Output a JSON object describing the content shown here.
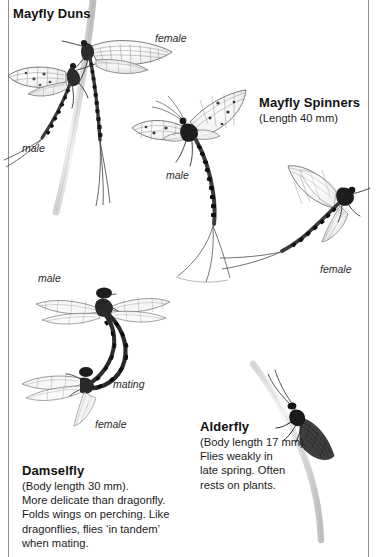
{
  "page": {
    "width": 384,
    "height": 557,
    "background": "#ffffff",
    "rule_color": "#8f8f8f",
    "ink_color": "#1a1a1a"
  },
  "sections": {
    "mayfly_duns": {
      "heading": "Mayfly Duns",
      "labels": [
        {
          "text": "female",
          "x": 155,
          "y": 32
        },
        {
          "text": "male",
          "x": 22,
          "y": 142
        }
      ]
    },
    "mayfly_spinners": {
      "heading": "Mayfly Spinners",
      "subline": "(Length 40 mm)",
      "labels": [
        {
          "text": "male",
          "x": 166,
          "y": 169
        },
        {
          "text": "female",
          "x": 320,
          "y": 263
        }
      ]
    },
    "damselfly": {
      "heading": "Damselfly",
      "blurb": "(Body length 30 mm).\nMore delicate than dragonfly.\nFolds wings on perching. Like\ndragonflies, flies ‘in tandem’\nwhen mating.",
      "labels": [
        {
          "text": "male",
          "x": 38,
          "y": 272
        },
        {
          "text": "mating",
          "x": 113,
          "y": 378
        },
        {
          "text": "female",
          "x": 95,
          "y": 418
        }
      ]
    },
    "alderfly": {
      "heading": "Alderfly",
      "blurb": "(Body length 17 mm).\nFlies weakly in\nlate spring. Often\nrests on plants."
    }
  },
  "illustrations": [
    {
      "name": "mayfly-dun-female",
      "kind": "insect-drawing"
    },
    {
      "name": "mayfly-dun-male",
      "kind": "insect-drawing"
    },
    {
      "name": "mayfly-spinner-male",
      "kind": "insect-drawing"
    },
    {
      "name": "mayfly-spinner-female",
      "kind": "insect-drawing"
    },
    {
      "name": "damselfly-mating-pair",
      "kind": "insect-drawing"
    },
    {
      "name": "alderfly-on-stem",
      "kind": "insect-drawing"
    },
    {
      "name": "plant-stem-upper",
      "kind": "plant-drawing"
    },
    {
      "name": "plant-stem-lower",
      "kind": "plant-drawing"
    }
  ]
}
